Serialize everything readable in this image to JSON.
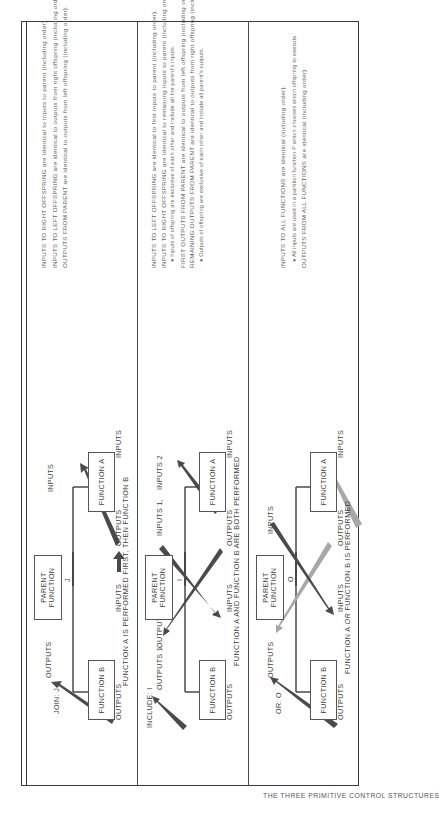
{
  "figure_title": "THE THREE PRIMITIVE CONTROL STRUCTURES",
  "panels": [
    {
      "id": "join",
      "type_label": "JOIN: J",
      "node_symbol": "J",
      "parent_box": "PARENT FUNCTION",
      "parent_box_lines": [
        "PARENT",
        "FUNCTION"
      ],
      "left_child": "FUNCTION B",
      "right_child": "FUNCTION A",
      "arrow_labels": {
        "top_left": "OUTPUTS",
        "top_right": "INPUTS",
        "bottom_left_outputs": "OUTPUTS",
        "bottom_mid_inputs": "INPUTS",
        "bottom_mid_outputs": "OUTPUTS",
        "bottom_right_inputs": "INPUTS"
      },
      "caption": "FUNCTION A IS PERFORMED FIRST, THEN FUNCTION B",
      "description": [
        "INPUTS TO RIGHT OFFSPRING are identical to inputs to parent (including order).",
        "INPUTS TO LEFT OFFSPRING are identical to outputs from right offspring (including order).",
        "OUTPUTS FROM PARENT are identical to outputs from left offspring (including order)."
      ]
    },
    {
      "id": "include",
      "type_label": "INCLUDE: I",
      "node_symbol": "I",
      "parent_box": "PARENT FUNCTION",
      "parent_box_lines": [
        "PARENT",
        "FUNCTION"
      ],
      "left_child": "FUNCTION B",
      "right_child": "FUNCTION A",
      "arrow_labels": {
        "top_outputs_1": "OUTPUTS 1,",
        "top_outputs_2": "OUTPUTS 2",
        "top_inputs_1": "INPUTS 1,",
        "top_inputs_2": "INPUTS 2",
        "bottom_left_outputs": "OUTPUTS",
        "bottom_mid_inputs": "INPUTS",
        "bottom_mid_outputs": "OUTPUTS",
        "bottom_right_inputs": "INPUTS"
      },
      "caption": "FUNCTION A AND FUNCTION B ARE BOTH PERFORMED",
      "description": [
        "INPUTS TO LEFT OFFSPRING are identical to first inputs to parent (including order).",
        "INPUTS TO RIGHT OFFSPRING are identical to remaining inputs to parent (including order).",
        "● Inputs of offspring are exclusive of each other and include all the parent's inputs.",
        "FIRST OUTPUTS FROM PARENT are identical to outputs from left offspring (including order).",
        "REMAINING OUTPUTS FROM PARENT are identical to outputs from right offspring (including order).",
        "● Outputs of offspring are exclusive of each other and include all parent's outputs."
      ]
    },
    {
      "id": "or",
      "type_label": "OR: O",
      "node_symbol": "O",
      "parent_box": "PARENT FUNCTION",
      "parent_box_lines": [
        "PARENT",
        "FUNCTION"
      ],
      "left_child": "FUNCTION B",
      "right_child": "FUNCTION A",
      "arrow_labels": {
        "top_outputs": "OUTPUTS",
        "top_inputs": "INPUTS",
        "bottom_left_outputs": "OUTPUTS",
        "bottom_mid_inputs": "INPUTS",
        "bottom_mid_outputs": "OUTPUTS",
        "bottom_right_inputs": "INPUTS"
      },
      "caption_parts": [
        "FUNCTION A ",
        "OR",
        " FUNCTION B IS PERFORMED"
      ],
      "description": [
        "INPUTS TO ALL FUNCTIONS are identical (including order).",
        "● All inputs are used in a partition function P which chooses which offspring to execute.",
        "OUTPUTS FROM ALL FUNCTIONS are identical (including order)."
      ]
    }
  ],
  "colors": {
    "arrow_dark": "#4a4a4a",
    "arrow_light": "#a8a8a8",
    "line": "#2e2e2e",
    "text": "#3f3f3f"
  }
}
